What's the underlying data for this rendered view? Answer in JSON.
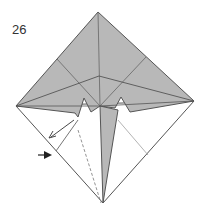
{
  "diagram": {
    "step_number": "26",
    "colors": {
      "paper_colored": "#b8b8b8",
      "paper_white": "#ffffff",
      "line": "#555555",
      "crease": "#999999",
      "arrow": "#333333"
    },
    "annotations": {
      "valley_fold_line": "dashed",
      "arrows": [
        "fold-direction-arrow",
        "push-arrow"
      ]
    }
  }
}
